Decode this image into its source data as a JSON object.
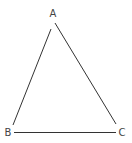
{
  "diagram": {
    "type": "triangle",
    "stroke_color": "#333333",
    "label_color": "#444444",
    "vertices": [
      {
        "label": "A",
        "x": 54,
        "y": 22,
        "label_x": 53,
        "label_y": 17
      },
      {
        "label": "B",
        "x": 13,
        "y": 131,
        "label_x": 8,
        "label_y": 136
      },
      {
        "label": "C",
        "x": 116,
        "y": 131,
        "label_x": 122,
        "label_y": 136
      }
    ],
    "edges": [
      {
        "from": "A",
        "to": "B"
      },
      {
        "from": "A",
        "to": "C"
      },
      {
        "from": "B",
        "to": "C"
      }
    ]
  }
}
